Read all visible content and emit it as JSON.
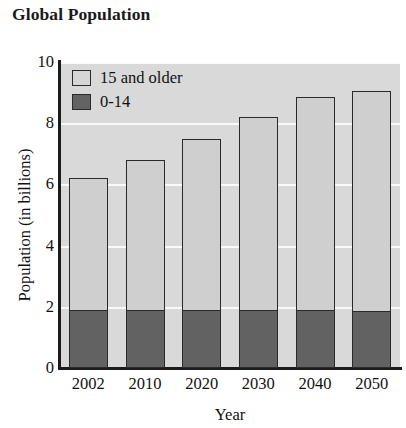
{
  "chart_data": {
    "type": "bar",
    "subtype": "stacked-bar",
    "title": "Global Population",
    "xlabel": "Year",
    "ylabel": "Population (in billions)",
    "categories": [
      "2002",
      "2010",
      "2020",
      "2030",
      "2040",
      "2050"
    ],
    "series": [
      {
        "name": "0-14",
        "values": [
          1.9,
          1.9,
          1.9,
          1.9,
          1.9,
          1.85
        ],
        "color": "#626262"
      },
      {
        "name": "15 and older",
        "values": [
          4.3,
          4.9,
          5.6,
          6.3,
          6.95,
          7.2
        ],
        "color": "#cfcfcf"
      }
    ],
    "totals": [
      6.2,
      6.8,
      7.5,
      8.2,
      8.85,
      9.05
    ],
    "ylim": [
      0,
      10
    ],
    "yticks": [
      0,
      2,
      4,
      6,
      8,
      10
    ],
    "ytick_labels": [
      "0",
      "2",
      "4",
      "6",
      "8",
      "10"
    ],
    "grid": true,
    "grid_axis": "y",
    "legend_position": "top-left-inside",
    "legend": [
      {
        "label": "15 and older",
        "swatch": "light"
      },
      {
        "label": "0-14",
        "swatch": "dark"
      }
    ],
    "plot_background": "#d9d9d9",
    "gridline_color": "#fafafa",
    "axis_color": "#1b1b1b"
  }
}
